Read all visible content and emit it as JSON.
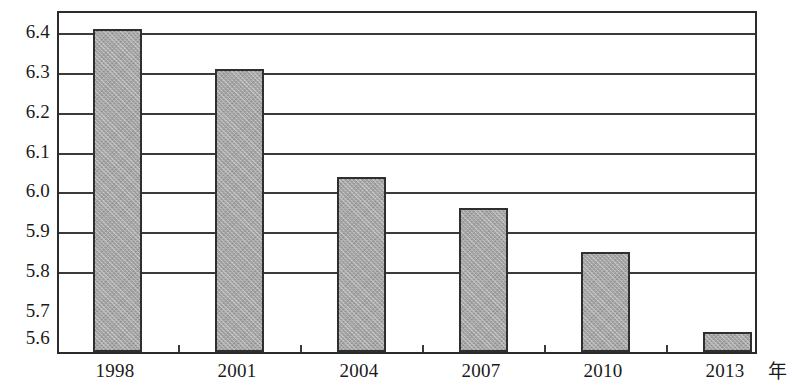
{
  "chart_data": {
    "type": "bar",
    "title": "",
    "subtitle": "",
    "xlabel": "年",
    "ylabel": "",
    "categories": [
      "1998",
      "2001",
      "2004",
      "2007",
      "2010",
      "2013"
    ],
    "values": [
      6.41,
      6.31,
      6.04,
      5.96,
      5.85,
      5.65
    ],
    "series": [
      {
        "name": "",
        "values": [
          6.41,
          6.31,
          6.04,
          5.96,
          5.85,
          5.65
        ]
      }
    ],
    "ylim": [
      5.6,
      6.45
    ],
    "y_ticks": [
      "5.6",
      "5.7",
      "5.8",
      "5.9",
      "6.0",
      "6.1",
      "6.2",
      "6.3",
      "6.4"
    ],
    "y_tick_values": [
      5.6,
      5.7,
      5.8,
      5.9,
      6.0,
      6.1,
      6.2,
      6.3,
      6.4
    ],
    "x_ticks": [
      "1998",
      "2001",
      "2004",
      "2007",
      "2010",
      "2013"
    ],
    "grid": "horizontal",
    "legend": "none",
    "legend_position": "none",
    "annotations": [],
    "colors": {
      "bar_fill": "#a9a9a9",
      "bar_border": "#2f2f2f",
      "grid": "#3a3a3a",
      "frame": "#2b2b2b",
      "text": "#1a1a1a",
      "background": "#ffffff"
    }
  }
}
